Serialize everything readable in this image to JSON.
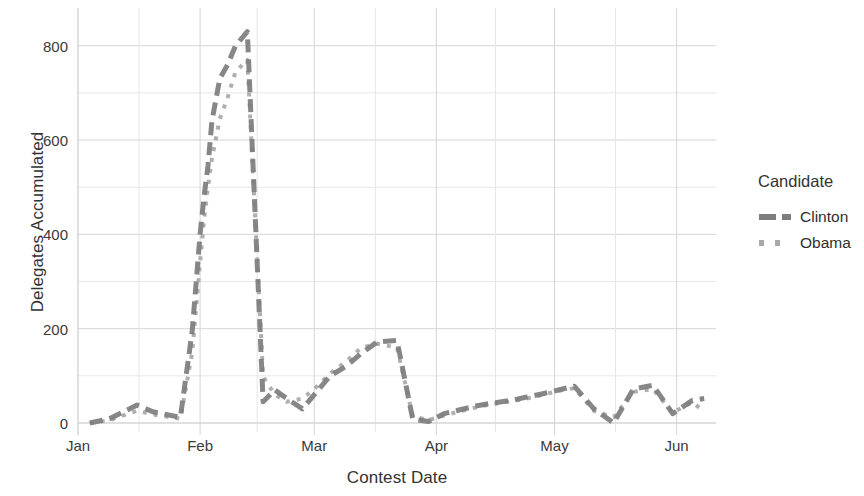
{
  "chart_data": {
    "type": "line",
    "title": "",
    "xlabel": "Contest Date",
    "ylabel": "Delegates Accumulated",
    "xlim": [
      "Jan",
      "Jun"
    ],
    "ylim": [
      0,
      880
    ],
    "grid": true,
    "legend_position": "right",
    "legend_title": "Candidate",
    "x_tick_labels": [
      "Jan",
      "Feb",
      "Mar",
      "Apr",
      "May",
      "Jun"
    ],
    "y_tick_labels": [
      "0",
      "200",
      "400",
      "600",
      "800"
    ],
    "y_tick_values": [
      0,
      200,
      400,
      600,
      800
    ],
    "y_minor_tick_values": [
      100,
      300,
      500,
      700
    ],
    "series": [
      {
        "name": "Clinton",
        "color": "#7d7d7d",
        "style": "dashed",
        "width": 5,
        "x": [
          3,
          8,
          15,
          19,
          26,
          29,
          31,
          32,
          33,
          34,
          36,
          38,
          40,
          43,
          47,
          50,
          53,
          57,
          60,
          64,
          68,
          72,
          76,
          81,
          85,
          89,
          93,
          97,
          101,
          105,
          110,
          114,
          118,
          122,
          126,
          131,
          136,
          141,
          146,
          151,
          156,
          159
        ],
        "values": [
          0,
          9,
          38,
          24,
          12,
          195,
          400,
          480,
          545,
          640,
          730,
          760,
          800,
          830,
          45,
          70,
          52,
          30,
          60,
          100,
          120,
          148,
          172,
          175,
          8,
          3,
          20,
          28,
          36,
          42,
          48,
          55,
          62,
          70,
          78,
          30,
          0,
          72,
          80,
          20,
          48,
          52
        ]
      },
      {
        "name": "Obama",
        "color": "#a8a8a8",
        "style": "dotted",
        "width": 4,
        "x": [
          3,
          8,
          15,
          19,
          26,
          29,
          31,
          32,
          33,
          34,
          36,
          38,
          40,
          43,
          47,
          50,
          53,
          57,
          60,
          64,
          68,
          72,
          76,
          81,
          85,
          89,
          93,
          97,
          101,
          105,
          110,
          114,
          118,
          122,
          126,
          131,
          136,
          141,
          146,
          151,
          156,
          159
        ],
        "values": [
          0,
          6,
          26,
          18,
          9,
          150,
          340,
          430,
          500,
          560,
          645,
          690,
          745,
          770,
          98,
          60,
          45,
          52,
          72,
          105,
          130,
          160,
          168,
          160,
          14,
          6,
          16,
          25,
          33,
          40,
          46,
          52,
          60,
          68,
          74,
          26,
          12,
          66,
          72,
          22,
          44,
          24
        ]
      }
    ]
  },
  "axes": {
    "y_title": "Delegates Accumulated",
    "x_title": "Contest Date"
  },
  "legend": {
    "title": "Candidate",
    "items": [
      {
        "label": "Clinton",
        "key": "dashed-line-key"
      },
      {
        "label": "Obama",
        "key": "dotted-line-key"
      }
    ]
  },
  "colors": {
    "clinton": "#7d7d7d",
    "obama": "#a8a8a8",
    "grid_major": "#d5d5d5",
    "grid_minor": "#e6e6e6",
    "text": "#333333"
  }
}
